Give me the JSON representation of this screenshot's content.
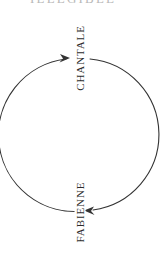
{
  "canvas": {
    "width": 160,
    "height": 255,
    "background_color": "#ffffff"
  },
  "cropped_header": {
    "text": "ILLEGIBLE",
    "note": "clipped text remnant at top edge"
  },
  "diagram": {
    "type": "cycle",
    "direction": "clockwise",
    "stroke_color": "#333333",
    "stroke_width": 1,
    "circle": {
      "center_x": 79,
      "center_y": 135,
      "radius": 76
    },
    "nodes": [
      {
        "id": "chantale",
        "label": "CHANTALE",
        "position": "top",
        "x": 79,
        "y": 58,
        "rotation_deg": -90
      },
      {
        "id": "fabienne",
        "label": "FABIENNE",
        "position": "bottom",
        "x": 79,
        "y": 212,
        "rotation_deg": -90
      }
    ],
    "arrows": [
      {
        "id": "arrow-to-chantale",
        "from": "fabienne",
        "to": "chantale",
        "side": "left",
        "head_x": 68,
        "head_y": 58,
        "head_direction": "right"
      },
      {
        "id": "arrow-to-fabienne",
        "from": "chantale",
        "to": "fabienne",
        "side": "right",
        "head_x": 89,
        "head_y": 211,
        "head_direction": "left"
      }
    ]
  }
}
